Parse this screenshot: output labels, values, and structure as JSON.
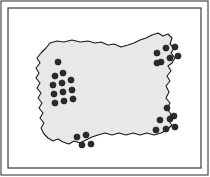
{
  "figure": {
    "type": "point-distribution-map",
    "canvas": {
      "width": 210,
      "height": 177
    },
    "colors": {
      "page_background": "#ffffff",
      "frame_outer_stroke": "#4a4a4a",
      "frame_inner_stroke": "#3a3a3a",
      "region_fill": "#e8e8e8",
      "region_stroke": "#1a1a1a",
      "dot_fill": "#2b2b2b",
      "dot_stroke": "#111111"
    },
    "frame": {
      "outer": {
        "x": 1,
        "y": 1,
        "width": 207,
        "height": 174,
        "stroke_width": 1.2
      },
      "inner": {
        "x": 8,
        "y": 8,
        "width": 193,
        "height": 160,
        "stroke_width": 1.2
      }
    },
    "region": {
      "name": "irregular-territory-outline",
      "fill": "#e8e8e8",
      "stroke": "#1a1a1a",
      "stroke_width": 1.1,
      "path": "M 46 48 L 50 43 L 57 41 L 64 42 L 72 40 L 80 42 L 88 41 L 95 43 L 101 42 L 108 45 L 114 44 L 121 47 L 128 45 L 134 43 L 140 40 L 146 38 L 152 35 L 158 33 L 163 36 L 168 34 L 172 38 L 170 44 L 174 48 L 171 53 L 175 58 L 172 63 L 168 66 L 171 71 L 167 76 L 170 81 L 166 86 L 169 92 L 166 98 L 170 103 L 167 109 L 171 114 L 168 120 L 172 125 L 167 130 L 161 133 L 154 135 L 147 133 L 140 135 L 133 133 L 126 135 L 119 133 L 112 135 L 105 133 L 98 135 L 92 137 L 86 140 L 80 143 L 74 141 L 69 144 L 63 142 L 58 139 L 53 141 L 48 138 L 44 134 L 41 128 L 44 123 L 40 118 L 43 113 L 39 108 L 42 103 L 38 98 L 41 93 L 37 88 L 40 83 L 36 78 L 39 73 L 36 68 L 40 63 L 37 58 L 41 53 Z"
    },
    "dots": {
      "radius": 3.1,
      "total_count": 31,
      "clusters": [
        {
          "name": "left-edge-cluster",
          "count": 12,
          "points": [
            {
              "x": 58,
              "y": 62
            },
            {
              "x": 55,
              "y": 76
            },
            {
              "x": 63,
              "y": 73
            },
            {
              "x": 53,
              "y": 85
            },
            {
              "x": 62,
              "y": 83
            },
            {
              "x": 71,
              "y": 80
            },
            {
              "x": 54,
              "y": 94
            },
            {
              "x": 63,
              "y": 92
            },
            {
              "x": 72,
              "y": 90
            },
            {
              "x": 55,
              "y": 103
            },
            {
              "x": 64,
              "y": 101
            },
            {
              "x": 73,
              "y": 99
            }
          ]
        },
        {
          "name": "top-right-cluster",
          "count": 7,
          "points": [
            {
              "x": 157,
              "y": 53
            },
            {
              "x": 166,
              "y": 48
            },
            {
              "x": 175,
              "y": 47
            },
            {
              "x": 161,
              "y": 62
            },
            {
              "x": 170,
              "y": 58
            },
            {
              "x": 178,
              "y": 56
            },
            {
              "x": 157,
              "y": 63
            }
          ]
        },
        {
          "name": "right-lower-cluster",
          "count": 7,
          "points": [
            {
              "x": 167,
              "y": 108
            },
            {
              "x": 160,
              "y": 120
            },
            {
              "x": 170,
              "y": 119
            },
            {
              "x": 156,
              "y": 130
            },
            {
              "x": 166,
              "y": 129
            },
            {
              "x": 175,
              "y": 127
            },
            {
              "x": 174,
              "y": 116
            }
          ]
        },
        {
          "name": "bottom-center-cluster",
          "count": 4,
          "points": [
            {
              "x": 77,
              "y": 137
            },
            {
              "x": 86,
              "y": 135
            },
            {
              "x": 82,
              "y": 145
            },
            {
              "x": 91,
              "y": 144
            }
          ]
        }
      ]
    }
  }
}
